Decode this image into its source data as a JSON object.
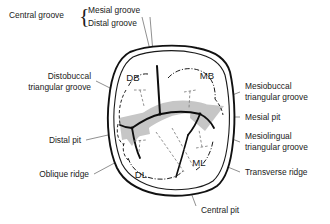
{
  "figure": {
    "view": "occlusal"
  },
  "colors": {
    "ink": "#1a1a1a",
    "outline": "#111111",
    "leader": "#4a4a4a",
    "ridge_shade": "#c6c6c6",
    "background": "#ffffff"
  },
  "labels": {
    "central_groove": "Central groove",
    "mesial_groove": "Mesial groove",
    "distal_groove": "Distal groove",
    "brace": "{",
    "distobuccal_triangular_groove_l1": "Distobuccal",
    "distobuccal_triangular_groove_l2": "triangular groove",
    "distal_pit": "Distal pit",
    "oblique_ridge": "Oblique ridge",
    "mesiobuccal_triangular_groove_l1": "Mesiobuccal",
    "mesiobuccal_triangular_groove_l2": "triangular groove",
    "mesial_pit": "Mesial pit",
    "mesiolingual_triangular_groove_l1": "Mesiolingual",
    "mesiolingual_triangular_groove_l2": "triangular groove",
    "transverse_ridge": "Transverse ridge",
    "central_pit": "Central pit"
  },
  "cusps": {
    "db": "DB",
    "mb": "MB",
    "dl": "DL",
    "ml": "ML"
  },
  "cusp_names": {
    "db": "distobuccal cusp",
    "mb": "mesiobuccal cusp",
    "dl": "distolingual cusp",
    "ml": "mesiolingual cusp"
  }
}
